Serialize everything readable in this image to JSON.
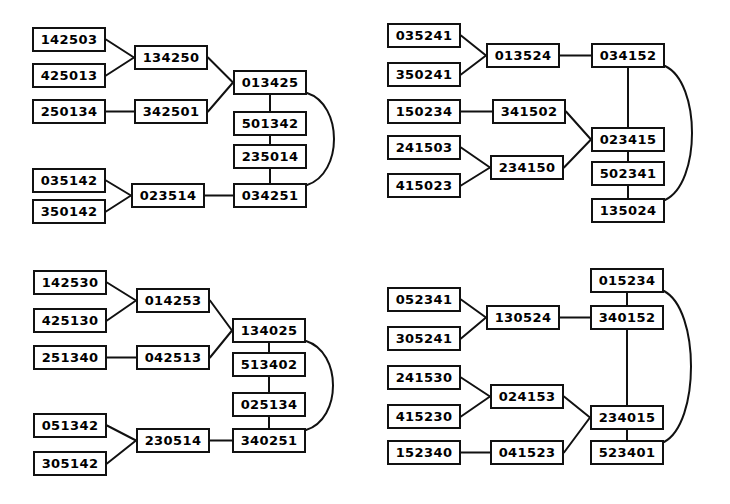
{
  "figure": {
    "title": "",
    "background_color": "#ffffff",
    "node_border_color": "#111111",
    "node_fill_color": "#ffffff",
    "edge_color": "#111111",
    "node_width": 74,
    "node_height": 25
  },
  "diagrams": [
    {
      "id": "top-left",
      "origin": {
        "x": 0,
        "y": 0
      },
      "nodes": [
        {
          "id": "tl1",
          "label": "142503",
          "x": 32,
          "y": 27
        },
        {
          "id": "tl2",
          "label": "425013",
          "x": 32,
          "y": 63
        },
        {
          "id": "tl3",
          "label": "134250",
          "x": 134,
          "y": 45
        },
        {
          "id": "tl4",
          "label": "250134",
          "x": 32,
          "y": 99
        },
        {
          "id": "tl5",
          "label": "342501",
          "x": 134,
          "y": 99
        },
        {
          "id": "tl6",
          "label": "013425",
          "x": 233,
          "y": 70
        },
        {
          "id": "tl7",
          "label": "501342",
          "x": 233,
          "y": 111
        },
        {
          "id": "tl8",
          "label": "235014",
          "x": 233,
          "y": 144
        },
        {
          "id": "tl9",
          "label": "034251",
          "x": 233,
          "y": 183
        },
        {
          "id": "tl10",
          "label": "035142",
          "x": 32,
          "y": 168
        },
        {
          "id": "tl11",
          "label": "350142",
          "x": 32,
          "y": 199
        },
        {
          "id": "tl12",
          "label": "023514",
          "x": 131,
          "y": 183
        }
      ],
      "edges": [
        {
          "from": "tl1",
          "to": "tl3",
          "kind": "straight"
        },
        {
          "from": "tl2",
          "to": "tl3",
          "kind": "straight"
        },
        {
          "from": "tl3",
          "to": "tl6",
          "kind": "straight"
        },
        {
          "from": "tl4",
          "to": "tl5",
          "kind": "straight"
        },
        {
          "from": "tl5",
          "to": "tl6",
          "kind": "straight"
        },
        {
          "from": "tl6",
          "to": "tl7",
          "kind": "vertical"
        },
        {
          "from": "tl7",
          "to": "tl8",
          "kind": "vertical"
        },
        {
          "from": "tl8",
          "to": "tl9",
          "kind": "vertical"
        },
        {
          "from": "tl6",
          "to": "tl9",
          "kind": "curve-right"
        },
        {
          "from": "tl10",
          "to": "tl12",
          "kind": "straight"
        },
        {
          "from": "tl11",
          "to": "tl12",
          "kind": "straight"
        },
        {
          "from": "tl12",
          "to": "tl9",
          "kind": "straight"
        }
      ]
    },
    {
      "id": "top-right",
      "origin": {
        "x": 365,
        "y": 0
      },
      "nodes": [
        {
          "id": "tr1",
          "label": "035241",
          "x": 22,
          "y": 23
        },
        {
          "id": "tr2",
          "label": "350241",
          "x": 22,
          "y": 62
        },
        {
          "id": "tr3",
          "label": "013524",
          "x": 121,
          "y": 43
        },
        {
          "id": "tr4",
          "label": "034152",
          "x": 226,
          "y": 43
        },
        {
          "id": "tr5",
          "label": "150234",
          "x": 22,
          "y": 99
        },
        {
          "id": "tr6",
          "label": "341502",
          "x": 127,
          "y": 99
        },
        {
          "id": "tr7",
          "label": "241503",
          "x": 22,
          "y": 135
        },
        {
          "id": "tr8",
          "label": "415023",
          "x": 22,
          "y": 173
        },
        {
          "id": "tr9",
          "label": "234150",
          "x": 125,
          "y": 155
        },
        {
          "id": "tr10",
          "label": "023415",
          "x": 226,
          "y": 127
        },
        {
          "id": "tr11",
          "label": "502341",
          "x": 226,
          "y": 161
        },
        {
          "id": "tr12",
          "label": "135024",
          "x": 226,
          "y": 198
        }
      ],
      "edges": [
        {
          "from": "tr1",
          "to": "tr3",
          "kind": "straight"
        },
        {
          "from": "tr2",
          "to": "tr3",
          "kind": "straight"
        },
        {
          "from": "tr3",
          "to": "tr4",
          "kind": "straight"
        },
        {
          "from": "tr5",
          "to": "tr6",
          "kind": "straight"
        },
        {
          "from": "tr6",
          "to": "tr10",
          "kind": "straight"
        },
        {
          "from": "tr7",
          "to": "tr9",
          "kind": "straight"
        },
        {
          "from": "tr8",
          "to": "tr9",
          "kind": "straight"
        },
        {
          "from": "tr9",
          "to": "tr10",
          "kind": "straight"
        },
        {
          "from": "tr4",
          "to": "tr10",
          "kind": "vertical"
        },
        {
          "from": "tr10",
          "to": "tr11",
          "kind": "vertical"
        },
        {
          "from": "tr11",
          "to": "tr12",
          "kind": "vertical"
        },
        {
          "from": "tr4",
          "to": "tr12",
          "kind": "curve-right"
        }
      ]
    },
    {
      "id": "bottom-left",
      "origin": {
        "x": 0,
        "y": 252
      },
      "nodes": [
        {
          "id": "bl1",
          "label": "142530",
          "x": 33,
          "y": 18
        },
        {
          "id": "bl2",
          "label": "425130",
          "x": 33,
          "y": 56
        },
        {
          "id": "bl3",
          "label": "014253",
          "x": 136,
          "y": 36
        },
        {
          "id": "bl4",
          "label": "251340",
          "x": 33,
          "y": 93
        },
        {
          "id": "bl5",
          "label": "042513",
          "x": 136,
          "y": 93
        },
        {
          "id": "bl6",
          "label": "134025",
          "x": 232,
          "y": 66
        },
        {
          "id": "bl7",
          "label": "513402",
          "x": 232,
          "y": 100
        },
        {
          "id": "bl8",
          "label": "025134",
          "x": 232,
          "y": 140
        },
        {
          "id": "bl9",
          "label": "340251",
          "x": 232,
          "y": 176
        },
        {
          "id": "bl10",
          "label": "051342",
          "x": 33,
          "y": 161
        },
        {
          "id": "bl11",
          "label": "305142",
          "x": 33,
          "y": 199
        },
        {
          "id": "bl12",
          "label": "230514",
          "x": 136,
          "y": 176
        }
      ],
      "edges": [
        {
          "from": "bl1",
          "to": "bl3",
          "kind": "straight"
        },
        {
          "from": "bl2",
          "to": "bl3",
          "kind": "straight"
        },
        {
          "from": "bl3",
          "to": "bl6",
          "kind": "straight"
        },
        {
          "from": "bl4",
          "to": "bl5",
          "kind": "straight"
        },
        {
          "from": "bl5",
          "to": "bl6",
          "kind": "straight"
        },
        {
          "from": "bl6",
          "to": "bl7",
          "kind": "vertical"
        },
        {
          "from": "bl7",
          "to": "bl8",
          "kind": "vertical"
        },
        {
          "from": "bl8",
          "to": "bl9",
          "kind": "vertical"
        },
        {
          "from": "bl6",
          "to": "bl9",
          "kind": "curve-right"
        },
        {
          "from": "bl10",
          "to": "bl12",
          "kind": "straight"
        },
        {
          "from": "bl11",
          "to": "bl12",
          "kind": "straight"
        },
        {
          "from": "bl12",
          "to": "bl9",
          "kind": "straight"
        }
      ]
    },
    {
      "id": "bottom-right",
      "origin": {
        "x": 365,
        "y": 252
      },
      "nodes": [
        {
          "id": "br1",
          "label": "015234",
          "x": 225,
          "y": 16
        },
        {
          "id": "br2",
          "label": "052341",
          "x": 22,
          "y": 35
        },
        {
          "id": "br3",
          "label": "305241",
          "x": 22,
          "y": 74
        },
        {
          "id": "br4",
          "label": "130524",
          "x": 121,
          "y": 53
        },
        {
          "id": "br5",
          "label": "340152",
          "x": 225,
          "y": 53
        },
        {
          "id": "br6",
          "label": "241530",
          "x": 22,
          "y": 113
        },
        {
          "id": "br7",
          "label": "415230",
          "x": 22,
          "y": 152
        },
        {
          "id": "br8",
          "label": "024153",
          "x": 125,
          "y": 132
        },
        {
          "id": "br9",
          "label": "152340",
          "x": 22,
          "y": 188
        },
        {
          "id": "br10",
          "label": "041523",
          "x": 125,
          "y": 188
        },
        {
          "id": "br11",
          "label": "234015",
          "x": 225,
          "y": 153
        },
        {
          "id": "br12",
          "label": "523401",
          "x": 225,
          "y": 188
        }
      ],
      "edges": [
        {
          "from": "br2",
          "to": "br4",
          "kind": "straight"
        },
        {
          "from": "br3",
          "to": "br4",
          "kind": "straight"
        },
        {
          "from": "br4",
          "to": "br5",
          "kind": "straight"
        },
        {
          "from": "br1",
          "to": "br5",
          "kind": "vertical"
        },
        {
          "from": "br5",
          "to": "br11",
          "kind": "vertical"
        },
        {
          "from": "br11",
          "to": "br12",
          "kind": "vertical"
        },
        {
          "from": "br1",
          "to": "br12",
          "kind": "curve-right"
        },
        {
          "from": "br6",
          "to": "br8",
          "kind": "straight"
        },
        {
          "from": "br7",
          "to": "br8",
          "kind": "straight"
        },
        {
          "from": "br8",
          "to": "br11",
          "kind": "straight"
        },
        {
          "from": "br9",
          "to": "br10",
          "kind": "straight"
        },
        {
          "from": "br10",
          "to": "br11",
          "kind": "straight"
        }
      ]
    }
  ]
}
